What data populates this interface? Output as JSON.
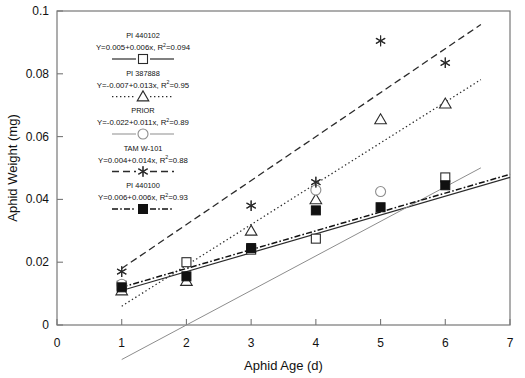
{
  "chart_data": {
    "type": "scatter",
    "title": "",
    "xlabel": "Aphid Age (d)",
    "ylabel": "Aphid Weight (mg)",
    "xlim": [
      0,
      7
    ],
    "ylim": [
      0,
      0.1
    ],
    "xticks": [
      "0",
      "1",
      "2",
      "3",
      "4",
      "5",
      "6",
      "7"
    ],
    "yticks": [
      "0",
      "0.02",
      "0.04",
      "0.06",
      "0.08",
      "0.1"
    ],
    "xtick_values": [
      0,
      1,
      2,
      3,
      4,
      5,
      6,
      7
    ],
    "ytick_values": [
      0,
      0.02,
      0.04,
      0.06,
      0.08,
      0.1
    ],
    "grid": false,
    "legend_position": "upper-left",
    "x": [
      1,
      2,
      3,
      4,
      5,
      6
    ],
    "series": [
      {
        "name": "PI 440102",
        "equation": "Y=0.005+0.006x, R",
        "r2_exponent": "2",
        "r2": "=0.094",
        "marker": "open-square",
        "line_style": "solid",
        "color": "#2b2b2b",
        "intercept": 0.005,
        "slope": 0.006,
        "values": [
          0.0125,
          0.02,
          0.024,
          0.0275,
          null,
          0.047
        ]
      },
      {
        "name": "PI 387888",
        "equation": "Y=-0.007+0.013x, R",
        "r2_exponent": "2",
        "r2": "=0.95",
        "marker": "open-triangle",
        "line_style": "dotted",
        "color": "#2b2b2b",
        "intercept": -0.007,
        "slope": 0.013,
        "values": [
          0.011,
          0.014,
          0.03,
          0.04,
          0.0655,
          0.0705
        ]
      },
      {
        "name": "PRIOR",
        "equation": "Y=-0.022+0.011x, R",
        "r2_exponent": "2",
        "r2": "=0.89",
        "marker": "open-circle",
        "line_style": "solid-light",
        "color": "#8d8d8d",
        "intercept": -0.022,
        "slope": 0.011,
        "values": [
          0.013,
          null,
          null,
          0.043,
          0.0425,
          null
        ]
      },
      {
        "name": "TAM W-101",
        "equation": "Y=0.004+0.014x, R",
        "r2_exponent": "2",
        "r2": "=0.88",
        "marker": "asterisk",
        "line_style": "dashed",
        "color": "#2b2b2b",
        "intercept": 0.004,
        "slope": 0.014,
        "values": [
          0.017,
          null,
          0.038,
          0.0455,
          0.0905,
          0.0835
        ]
      },
      {
        "name": "PI 440100",
        "equation": "Y=0.006+0.006x, R",
        "r2_exponent": "2",
        "r2": "=0.93",
        "marker": "filled-square",
        "line_style": "dashdot",
        "color": "#111111",
        "intercept": 0.006,
        "slope": 0.006,
        "values": [
          0.012,
          0.0155,
          0.0245,
          0.0365,
          0.0375,
          0.0445
        ]
      }
    ]
  }
}
